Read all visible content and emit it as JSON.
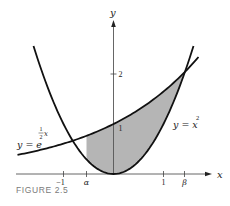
{
  "caption": "FIGURE 2.5",
  "chart_data": {
    "type": "line",
    "title": "",
    "xlabel": "x",
    "ylabel": "y",
    "xlim": [
      -2.0,
      2.0
    ],
    "ylim": [
      0,
      3.0
    ],
    "grid": false,
    "legend": "none (curves labeled inline)",
    "series": [
      {
        "name": "y = e^{x/2}",
        "label_main": "y = e",
        "label_exp_num": "1",
        "label_exp_den": "2",
        "label_exp_var": "x",
        "function": "exp(x/2)",
        "x_range": [
          -1.92,
          1.7
        ],
        "points": [
          [
            -1.9,
            0.39
          ],
          [
            -1.0,
            0.61
          ],
          [
            -0.54,
            0.76
          ],
          [
            0,
            1.0
          ],
          [
            0.5,
            1.28
          ],
          [
            1.0,
            1.65
          ],
          [
            1.42,
            2.03
          ],
          [
            1.7,
            2.34
          ]
        ]
      },
      {
        "name": "y = x^2",
        "label_main": "y = x",
        "label_exp": "2",
        "function": "x^2",
        "x_range": [
          -1.6,
          1.6
        ],
        "points": [
          [
            -1.6,
            2.56
          ],
          [
            -1.0,
            1.0
          ],
          [
            -0.54,
            0.29
          ],
          [
            0,
            0
          ],
          [
            0.5,
            0.25
          ],
          [
            1.0,
            1.0
          ],
          [
            1.42,
            2.02
          ],
          [
            1.6,
            2.56
          ]
        ]
      }
    ],
    "shaded_region": {
      "description": "area between y = x^2 (below) and y = e^{x/2} (above) for alpha <= x <= beta",
      "from": "alpha",
      "to": "beta",
      "color": "#b5b5b5"
    },
    "intersections": [
      {
        "name": "alpha",
        "x": -0.54,
        "y": 0.29
      },
      {
        "name": "beta",
        "x": 1.42,
        "y": 2.03
      }
    ],
    "x_ticks": [
      {
        "value": -1,
        "label": "−1"
      },
      {
        "value": -0.54,
        "label": "α"
      },
      {
        "value": 1,
        "label": "1"
      },
      {
        "value": 1.42,
        "label": "β"
      }
    ],
    "y_ticks": [
      {
        "value": 1,
        "label": "1"
      },
      {
        "value": 2,
        "label": "2"
      }
    ],
    "annotations": []
  },
  "layout": {
    "origin_px": [
      113.5,
      174
    ],
    "unit_px": 50,
    "x_axis_px": [
      16,
      212
    ],
    "y_axis_top_px": 20
  }
}
